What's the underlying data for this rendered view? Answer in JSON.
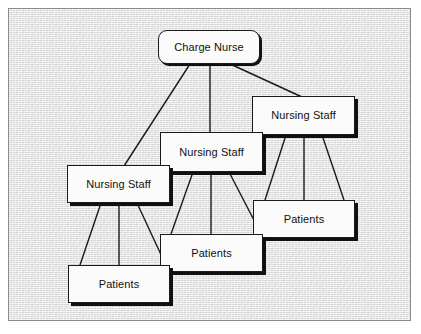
{
  "diagram": {
    "background_color": "#e9e9e9",
    "frame_border_color": "#8a8a8a",
    "node_fill_color": "#fbfbfb",
    "node_border_color": "#1a1a1a",
    "edge_color": "#1a1a1a",
    "nodes": [
      {
        "id": "charge-nurse",
        "label": "Charge Nurse",
        "shape": "rounded-rectangle",
        "x": 158,
        "y": 30,
        "width": 102,
        "height": 34
      },
      {
        "id": "nursing-staff-right",
        "label": "Nursing Staff",
        "shape": "rectangle",
        "x": 252,
        "y": 96,
        "width": 103,
        "height": 39
      },
      {
        "id": "nursing-staff-center",
        "label": "Nursing Staff",
        "shape": "rectangle",
        "x": 160,
        "y": 132,
        "width": 103,
        "height": 40
      },
      {
        "id": "nursing-staff-left",
        "label": "Nursing Staff",
        "shape": "rectangle",
        "x": 67,
        "y": 165,
        "width": 103,
        "height": 38
      },
      {
        "id": "patients-right",
        "label": "Patients",
        "shape": "rectangle",
        "x": 253,
        "y": 200,
        "width": 102,
        "height": 38
      },
      {
        "id": "patients-center",
        "label": "Patients",
        "shape": "rectangle",
        "x": 160,
        "y": 234,
        "width": 103,
        "height": 38
      },
      {
        "id": "patients-left",
        "label": "Patients",
        "shape": "rectangle",
        "x": 68,
        "y": 265,
        "width": 102,
        "height": 38
      }
    ],
    "edges": [
      {
        "from": "charge-nurse",
        "to": "nursing-staff-left",
        "x1": 190,
        "y1": 64,
        "x2": 124,
        "y2": 166
      },
      {
        "from": "charge-nurse",
        "to": "nursing-staff-center",
        "x1": 210,
        "y1": 64,
        "x2": 210,
        "y2": 133
      },
      {
        "from": "charge-nurse",
        "to": "nursing-staff-right",
        "x1": 228,
        "y1": 63,
        "x2": 302,
        "y2": 97
      },
      {
        "from": "nursing-staff-right",
        "to": "patients-right",
        "x1": 286,
        "y1": 135,
        "x2": 265,
        "y2": 200
      },
      {
        "from": "nursing-staff-right",
        "to": "patients-right",
        "x1": 304,
        "y1": 135,
        "x2": 304,
        "y2": 200
      },
      {
        "from": "nursing-staff-right",
        "to": "patients-right",
        "x1": 322,
        "y1": 135,
        "x2": 344,
        "y2": 200
      },
      {
        "from": "nursing-staff-center",
        "to": "patients-center",
        "x1": 193,
        "y1": 172,
        "x2": 171,
        "y2": 234
      },
      {
        "from": "nursing-staff-center",
        "to": "patients-center",
        "x1": 211,
        "y1": 172,
        "x2": 211,
        "y2": 234
      },
      {
        "from": "nursing-staff-center",
        "to": "patients-right",
        "x1": 229,
        "y1": 172,
        "x2": 256,
        "y2": 224
      },
      {
        "from": "nursing-staff-left",
        "to": "patients-left",
        "x1": 101,
        "y1": 203,
        "x2": 80,
        "y2": 265
      },
      {
        "from": "nursing-staff-left",
        "to": "patients-left",
        "x1": 119,
        "y1": 203,
        "x2": 119,
        "y2": 265
      },
      {
        "from": "nursing-staff-left",
        "to": "patients-center",
        "x1": 137,
        "y1": 203,
        "x2": 163,
        "y2": 259
      }
    ]
  }
}
